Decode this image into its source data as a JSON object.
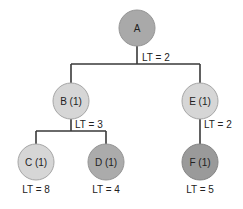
{
  "diagram": {
    "type": "tree",
    "colors": {
      "edge": "#3a3a3a",
      "node_stroke": "#9a9a9a",
      "light_node_fill": "#d4d4d4",
      "dark_node_fill": "#a8a8a8",
      "text": "#222222"
    },
    "nodes": [
      {
        "id": "A",
        "label": "A",
        "shade": "dark"
      },
      {
        "id": "B",
        "label": "B (1)",
        "shade": "light"
      },
      {
        "id": "E",
        "label": "E (1)",
        "shade": "light"
      },
      {
        "id": "C",
        "label": "C (1)",
        "shade": "light"
      },
      {
        "id": "D",
        "label": "D (1)",
        "shade": "dark"
      },
      {
        "id": "F",
        "label": "F (1)",
        "shade": "darker"
      }
    ],
    "edges": [
      {
        "from": "A",
        "to": "B"
      },
      {
        "from": "A",
        "to": "E"
      },
      {
        "from": "B",
        "to": "C"
      },
      {
        "from": "B",
        "to": "D"
      },
      {
        "from": "E",
        "to": "F"
      }
    ],
    "lt_labels": {
      "A": "LT = 2",
      "B": "LT = 3",
      "E": "LT = 2",
      "C": "LT = 8",
      "D": "LT = 4",
      "F": "LT = 5"
    }
  }
}
